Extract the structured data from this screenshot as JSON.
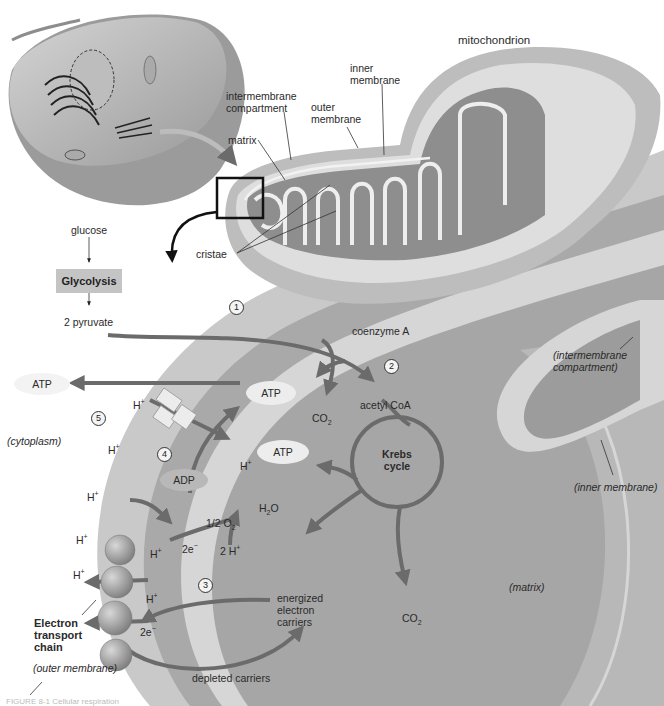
{
  "figure": {
    "title_label": "mitochondrion",
    "caption_fragment": "FIGURE 8-1 Cellular respiration"
  },
  "mitochondrion_labels": {
    "inner_membrane": "inner membrane",
    "intermembrane_compartment": "intermembrane compartment",
    "outer_membrane": "outer membrane",
    "matrix": "matrix",
    "cristae": "cristae"
  },
  "glycolysis": {
    "input": "glucose",
    "process": "Glycolysis",
    "output": "2 pyruvate"
  },
  "steps": [
    "1",
    "2",
    "3",
    "4",
    "5"
  ],
  "molecules": {
    "coenzyme_a": "coenzyme A",
    "acetyl_coa": "acetyl CoA",
    "co2_top": "CO",
    "co2_bottom": "CO",
    "co2_sub": "2",
    "atp_cytoplasm": "ATP",
    "atp_synthase": "ATP",
    "atp_krebs": "ATP",
    "adp": "ADP",
    "krebs_cycle": "Krebs cycle",
    "half_o2": "1/2 O",
    "o2_sub": "2",
    "h2o_h": "H",
    "h2o_sub": "2",
    "h2o_o": "O",
    "two_h": "2 H",
    "plus": "+",
    "two_e": "2e",
    "minus": "−",
    "h_ion": "H",
    "energized_carriers": "energized electron carriers",
    "depleted_carriers": "depleted carriers",
    "etc": "Electron transport chain"
  },
  "region_labels": {
    "cytoplasm": "(cytoplasm)",
    "intermembrane_compartment": "(intermembrane compartment)",
    "inner_membrane": "(inner membrane)",
    "matrix": "(matrix)",
    "outer_membrane": "(outer membrane)"
  },
  "colors": {
    "background": "#ffffff",
    "outer_band": "#c9c9c9",
    "intermembrane": "#a9a9a9",
    "inner_band": "#d6d6d6",
    "matrix": "#a6a6a6",
    "arrow": "#6b6b6b",
    "glycolysis_box": "#c4c4c4"
  }
}
